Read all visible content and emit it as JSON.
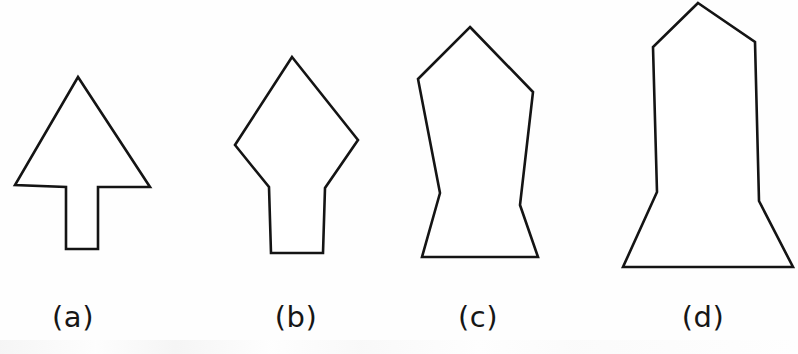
{
  "figure": {
    "background_color": "#fefefe",
    "stroke_color": "#141414",
    "fill_color": "#ffffff",
    "width": 798,
    "height": 354,
    "shapes": [
      {
        "id": "shape-a",
        "label": "(a)",
        "label_x": 73,
        "label_y": 300,
        "name": "arrow-up-shape",
        "points": "78,77 150,187 98,187 98,249 66,249 66,187 15,185"
      },
      {
        "id": "shape-b",
        "label": "(b)",
        "label_x": 296,
        "label_y": 300,
        "name": "diamond-stem-shape",
        "points": "292,57 358,140 325,188 323,253 271,253 269,187 235,145"
      },
      {
        "id": "shape-c",
        "label": "(c)",
        "label_x": 478,
        "label_y": 300,
        "name": "pentagon-waisted-shape",
        "points": "470,27 533,92 520,205 538,257 422,257 440,193 418,79"
      },
      {
        "id": "shape-d",
        "label": "(d)",
        "label_x": 703,
        "label_y": 300,
        "name": "obelisk-flared-base-shape",
        "points": "698,3 755,42 759,201 793,267 623,267 657,192 653,47"
      }
    ]
  }
}
